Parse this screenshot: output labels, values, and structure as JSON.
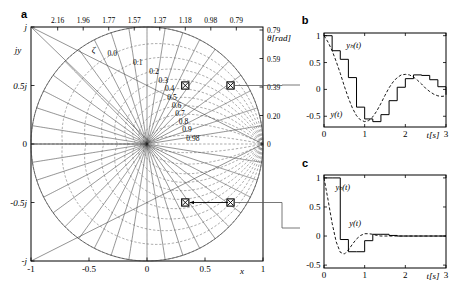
{
  "figure": {
    "panels": [
      {
        "key": "a",
        "letter": "a"
      },
      {
        "key": "b",
        "letter": "b"
      },
      {
        "key": "c",
        "letter": "c"
      }
    ]
  },
  "panel_a": {
    "letter": "a",
    "axis_labels": {
      "y_axis_name": "jy",
      "x_axis_name": "x",
      "top_axis_name": "",
      "right_axis_name": "θ[rad]",
      "zeta_symbol": "ζ"
    },
    "x_ticks": [
      {
        "value": -1,
        "label": "-1"
      },
      {
        "value": -0.5,
        "label": "-0.5"
      },
      {
        "value": 0,
        "label": "0"
      },
      {
        "value": 0.5,
        "label": "0.5"
      },
      {
        "value": 1,
        "label": "1"
      }
    ],
    "y_ticks": [
      {
        "value": 1,
        "label": "j"
      },
      {
        "value": 0.5,
        "label": "0.5j"
      },
      {
        "value": 0,
        "label": "0"
      },
      {
        "value": -0.5,
        "label": "-0.5j"
      },
      {
        "value": -1,
        "label": "-j"
      }
    ],
    "top_ticks": [
      {
        "label": "2.16"
      },
      {
        "label": "1.96"
      },
      {
        "label": "1.77"
      },
      {
        "label": "1.57"
      },
      {
        "label": "1.37"
      },
      {
        "label": "1.18"
      },
      {
        "label": "0.98"
      },
      {
        "label": "0.79"
      }
    ],
    "right_ticks": [
      {
        "label": "0.79"
      },
      {
        "label": "0.59"
      },
      {
        "label": "0.39"
      },
      {
        "label": "0.20"
      },
      {
        "label": "0"
      }
    ],
    "zeta_labels": [
      "0.0",
      "0.1",
      "0.2",
      "0.3",
      "0.4",
      "0.5",
      "0.6",
      "0.7",
      "0.8",
      "0.9",
      "0.98"
    ],
    "zeta_values": [
      0.0,
      0.1,
      0.2,
      0.3,
      0.4,
      0.5,
      0.6,
      0.7,
      0.8,
      0.9,
      0.98
    ],
    "wn_values": [
      0.79,
      0.98,
      1.18,
      1.37,
      1.57,
      1.77,
      1.96,
      2.16,
      2.36,
      2.55,
      2.75,
      2.95,
      3.14
    ],
    "markers": [
      {
        "name": "pole-upper-left",
        "x": 0.33,
        "y": 0.5
      },
      {
        "name": "pole-upper-right",
        "x": 0.72,
        "y": 0.5
      },
      {
        "name": "pole-lower-left",
        "x": 0.33,
        "y": -0.5
      },
      {
        "name": "pole-lower-right",
        "x": 0.72,
        "y": -0.5
      }
    ],
    "arrows": [
      {
        "name": "pole-shift-arrow",
        "from_x": 0.7,
        "from_y": -0.5,
        "to_x": 0.37,
        "to_y": -0.5
      }
    ]
  },
  "chart_data": [
    {
      "type": "line",
      "panel": "a",
      "title": "z-plane constant damping-ratio and constant natural-frequency grid",
      "xlabel": "x",
      "ylabel": "jy",
      "xlim": [
        -1,
        1
      ],
      "ylim": [
        -1,
        1
      ],
      "grid": true,
      "legend": "none",
      "annotations": [
        "ζ",
        "θ[rad]"
      ],
      "zeta_contours": [
        0.0,
        0.1,
        0.2,
        0.3,
        0.4,
        0.5,
        0.6,
        0.7,
        0.8,
        0.9,
        0.98
      ],
      "theta_rays_rad": [
        0.79,
        0.98,
        1.18,
        1.37,
        1.57,
        1.77,
        1.96,
        2.16
      ],
      "theta_axis_ticks": [
        0.79,
        0.59,
        0.39,
        0.2,
        0.0
      ],
      "marked_poles": [
        {
          "x": 0.33,
          "y": 0.5
        },
        {
          "x": 0.72,
          "y": 0.5
        },
        {
          "x": 0.33,
          "y": -0.5
        },
        {
          "x": 0.72,
          "y": -0.5
        }
      ]
    },
    {
      "type": "line",
      "panel": "b",
      "title": "",
      "xlabel": "t[s]",
      "ylabel": "",
      "xlim": [
        0,
        3
      ],
      "ylim": [
        -0.7,
        1.05
      ],
      "grid": false,
      "x_ticks": [
        {
          "value": 0,
          "label": "0"
        },
        {
          "value": 1,
          "label": "1"
        },
        {
          "value": 2,
          "label": "2"
        },
        {
          "value": 3,
          "label": "3"
        }
      ],
      "y_ticks": [
        {
          "value": 1,
          "label": "1"
        },
        {
          "value": 0.5,
          "label": "0.5"
        },
        {
          "value": 0,
          "label": "0"
        },
        {
          "value": -0.5,
          "label": "-0.5"
        }
      ],
      "series": [
        {
          "name": "y_s(t)",
          "label": "yₕ(t)",
          "style": "staircase",
          "sample_period": 0.2,
          "x": [
            0,
            0.2,
            0.4,
            0.6,
            0.8,
            1.0,
            1.2,
            1.4,
            1.6,
            1.8,
            2.0,
            2.2,
            2.4,
            2.6,
            2.8,
            3.0
          ],
          "values": [
            1.0,
            0.72,
            0.56,
            0.22,
            -0.33,
            -0.55,
            -0.6,
            -0.47,
            -0.21,
            0.04,
            0.2,
            0.27,
            0.26,
            0.18,
            0.05,
            -0.1
          ]
        },
        {
          "name": "y(t)",
          "label": "y(t)",
          "style": "dashed",
          "x": [
            0,
            0.1,
            0.2,
            0.3,
            0.4,
            0.5,
            0.6,
            0.7,
            0.8,
            0.9,
            1.0,
            1.1,
            1.2,
            1.3,
            1.4,
            1.5,
            1.6,
            1.7,
            1.8,
            1.9,
            2.0,
            2.1,
            2.2,
            2.3,
            2.4,
            2.5,
            2.6,
            2.7,
            2.8,
            2.9,
            3.0
          ],
          "values": [
            1.0,
            0.88,
            0.72,
            0.52,
            0.3,
            0.06,
            -0.16,
            -0.35,
            -0.49,
            -0.57,
            -0.6,
            -0.58,
            -0.51,
            -0.4,
            -0.26,
            -0.11,
            0.03,
            0.14,
            0.22,
            0.27,
            0.28,
            0.27,
            0.23,
            0.17,
            0.1,
            0.02,
            -0.04,
            -0.09,
            -0.12,
            -0.13,
            -0.12
          ]
        }
      ]
    },
    {
      "type": "line",
      "panel": "c",
      "title": "",
      "xlabel": "t[s]",
      "ylabel": "",
      "xlim": [
        0,
        3
      ],
      "ylim": [
        -0.55,
        1.05
      ],
      "grid": false,
      "x_ticks": [
        {
          "value": 0,
          "label": "0"
        },
        {
          "value": 1,
          "label": "1"
        },
        {
          "value": 2,
          "label": "2"
        },
        {
          "value": 3,
          "label": "3"
        }
      ],
      "y_ticks": [
        {
          "value": 1,
          "label": "1"
        },
        {
          "value": 0.5,
          "label": "0.5"
        },
        {
          "value": 0,
          "label": "0"
        },
        {
          "value": -0.5,
          "label": "-0.5"
        }
      ],
      "series": [
        {
          "name": "y_s(t)",
          "label": "yₕ(t)",
          "style": "staircase",
          "sample_period": 0.2,
          "x": [
            0,
            0.2,
            0.4,
            0.6,
            0.8,
            1.0,
            1.2,
            1.4,
            1.6,
            1.8,
            2.0,
            2.2,
            2.4,
            2.6,
            2.8,
            3.0
          ],
          "values": [
            1.0,
            1.0,
            -0.06,
            -0.27,
            -0.27,
            -0.08,
            0.03,
            0.03,
            0.01,
            0.0,
            0.0,
            0.0,
            0.0,
            0.0,
            0.0,
            0.0
          ]
        },
        {
          "name": "y(t)",
          "label": "y(t)",
          "style": "dashed",
          "x": [
            0,
            0.1,
            0.2,
            0.3,
            0.4,
            0.5,
            0.6,
            0.7,
            0.8,
            0.9,
            1.0,
            1.1,
            1.2,
            1.3,
            1.4,
            1.5,
            1.6,
            1.8,
            2.0,
            2.5,
            3.0
          ],
          "values": [
            1.0,
            0.62,
            0.22,
            -0.1,
            -0.28,
            -0.31,
            -0.24,
            -0.14,
            -0.05,
            0.01,
            0.04,
            0.04,
            0.03,
            0.01,
            0.0,
            0.0,
            0.0,
            0.0,
            0.0,
            0.0,
            0.0
          ]
        }
      ]
    }
  ],
  "panel_b": {
    "letter": "b",
    "x_axis_label": "t[s]",
    "series_labels": {
      "sampled": "yₕ(t)",
      "continuous": "y(t)"
    },
    "x_tick_labels": [
      "0",
      "1",
      "2",
      "3"
    ],
    "y_tick_labels": [
      "1",
      "0.5",
      "0",
      "-0.5"
    ]
  },
  "panel_c": {
    "letter": "c",
    "x_axis_label": "t[s]",
    "series_labels": {
      "sampled": "yₕ(t)",
      "continuous": "y(t)"
    },
    "x_tick_labels": [
      "0",
      "1",
      "2",
      "3"
    ],
    "y_tick_labels": [
      "1",
      "0.5",
      "0",
      "-0.5"
    ]
  },
  "colors": {
    "ink": "#000000",
    "background": "#ffffff",
    "grid_solid": "#3a3a3a",
    "grid_dashed": "#555555"
  }
}
